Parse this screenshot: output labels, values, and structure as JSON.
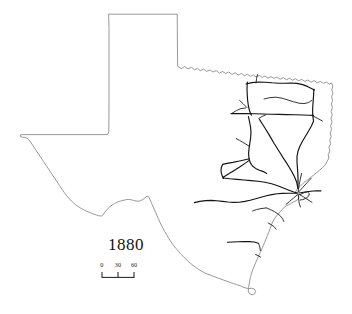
{
  "figure": {
    "kind": "historical-thematic-map",
    "year_label": "1880",
    "background_color": "#ffffff",
    "outline_color": "#8c8c8c",
    "rail_color": "#121212",
    "text_color": "#141414"
  },
  "scale_bar": {
    "unit_note": "",
    "ticks": [
      {
        "label": "0",
        "value": 0,
        "x_pct": 14
      },
      {
        "label": "30",
        "value": 30,
        "x_pct": 37
      },
      {
        "label": "60",
        "value": 60,
        "x_pct": 60
      }
    ]
  },
  "map": {
    "state_outline_path": "M109.0,14.2 L177.2,14.2 L177.4,40.0 L177.6,66.2 L181.4,68.6 L184.6,66.6 L188.0,68.8 L191.6,67.4 L194.4,69.8 L197.6,68.4 L200.2,70.6 L203.4,69.2 L206.6,71.4 L210.0,69.9 L213.0,72.0 L216.2,70.6 L219.4,73.0 L222.6,71.4 L225.6,73.6 L228.8,72.0 L232.0,74.4 L235.2,72.8 L238.2,75.0 L241.4,73.4 L244.4,75.8 L247.4,74.2 L250.4,76.4 L253.2,74.8 L256.2,77.0 L259.2,75.4 L262.2,77.4 L265.0,76.0 L268.0,78.2 L271.0,76.6 L274.0,78.4 L277.0,77.0 L280.2,79.2 L283.4,77.6 L286.4,79.8 L289.6,78.2 L292.6,80.2 L295.6,78.8 L298.6,80.8 L301.8,79.4 L304.8,81.4 L307.8,80.0 L311.0,82.2 L314.2,80.6 L317.4,82.8 L320.4,81.4 L323.4,83.4 L326.4,82.0 L329.2,84.2 L331.6,83.0 L332.8,86.0 L331.8,89.6 L332.8,93.2 L331.6,96.8 L332.6,100.4 L331.4,104.0 L332.4,107.6 L331.2,111.4 L332.2,115.0 L331.0,118.6 L332.0,122.2 L330.6,125.8 L331.6,129.4 L330.2,133.0 L331.2,136.6 L329.8,140.2 L330.6,143.8 L329.0,147.4 L329.8,151.0 L328.2,154.6 L328.8,158.2 L327.0,161.6 L325.2,164.8 L322.6,167.6 L319.6,170.2 L316.4,172.8 L313.2,175.4 L310.0,178.0 L306.6,180.6 L303.2,183.2 L300.2,186.2 L297.4,189.2 L295.0,192.4 L296.8,194.4 L299.0,196.2 L298.4,199.0 L296.0,200.8 L293.0,202.2 L290.2,203.8 L287.0,205.4 L284.0,207.6 L281.4,210.2 L279.0,213.0 L276.6,215.8 L274.4,218.8 L272.6,222.0 L271.2,225.4 L270.0,228.8 L268.8,232.2 L267.4,235.6 L266.0,239.0 L264.6,242.4 L263.2,245.8 L261.8,249.2 L260.2,252.6 L258.6,256.0 L257.0,259.4 L255.6,262.8 L254.2,266.2 L252.8,269.6 L251.6,273.0 L250.6,276.6 L249.8,280.2 L249.2,283.8 L248.6,287.4 L248.2,291.0 L249.4,293.6 L252.2,294.8 L254.6,293.8 L255.6,291.4 L254.2,289.0 L251.6,288.2 L249.0,288.6 L245.8,288.0 L242.8,287.0 L239.8,285.6 L236.6,284.6 L233.4,283.6 L230.2,282.4 L227.0,281.2 L223.8,280.2 L220.6,279.0 L217.4,277.8 L214.2,276.6 L211.0,275.4 L207.8,274.2 L204.6,272.8 L201.6,271.2 L198.6,269.4 L195.8,267.4 L193.0,265.4 L190.4,263.2 L187.8,261.0 L185.4,258.6 L183.0,256.2 L180.6,253.8 L178.4,251.2 L176.2,248.6 L174.0,246.0 L172.0,243.2 L170.0,240.4 L168.2,237.4 L166.4,234.4 L164.6,231.4 L163.0,228.4 L161.4,225.2 L159.8,222.0 L158.4,218.8 L157.0,215.6 L155.6,212.4 L154.2,209.2 L152.8,206.0 L151.4,202.8 L150.0,199.6 L148.6,196.6 L147.0,196.0 L145.0,197.8 L143.0,199.4 L140.8,200.6 L138.4,201.2 L136.0,201.0 L133.6,200.4 L131.2,199.8 L128.8,199.4 L126.4,199.6 L124.0,200.2 L121.6,200.8 L119.2,201.4 L116.8,202.4 L114.4,203.6 L112.2,205.0 L110.0,206.6 L108.0,208.4 L106.2,210.4 L104.6,212.6 L103.2,214.8 L101.4,216.0 L99.0,215.8 L96.6,215.0 L94.2,214.2 L91.8,213.4 L89.4,212.4 L87.0,211.4 L84.6,210.2 L82.2,209.0 L79.8,207.6 L77.6,206.2 L75.4,204.6 L73.4,202.8 L71.4,201.0 L69.6,199.0 L67.8,197.0 L66.0,194.8 L64.4,192.6 L62.8,190.4 L61.2,188.0 L59.6,185.6 L58.0,183.2 L56.4,180.8 L54.8,178.4 L53.2,176.0 L51.6,173.6 L50.0,171.2 L48.4,168.8 L46.8,166.4 L45.2,164.0 L43.6,161.6 L42.0,159.2 L40.4,156.8 L38.8,154.4 L37.2,152.0 L35.6,149.6 L34.0,147.2 L32.4,144.8 L30.8,142.4 L29.2,140.2 L27.2,138.4 L24.8,137.4 L22.2,137.2 L20.2,136.4 L20.4,134.8 L23.4,134.6 L27.0,134.6 L31.0,134.6 L36.0,134.6 L42.0,134.6 L49.0,134.6 L57.0,134.6 L66.0,134.6 L75.0,134.6 L84.0,134.6 L92.0,134.6 L99.0,134.6 L104.0,134.6 L107.6,134.6 L108.8,132.0 L108.9,120.0 L109.0,104.0 L109.0,86.0 L109.0,66.0 L109.0,46.0 L109.0,28.0 Z",
    "rail_lines": [
      {
        "name": "red-river-northeast-trunk",
        "path": "M246.0,84.0 L252.0,82.6 L258.6,82.0 L265.4,82.2 L272.0,82.8 L278.6,83.2 L285.0,83.2 L291.0,83.0 L297.0,83.4 L302.6,84.6 L307.4,86.4 L311.4,88.4 L314.6,90.0",
        "weight": "normal"
      },
      {
        "name": "northeast-loop-north-edge",
        "path": "M247.4,82.0 L247.0,88.0 L247.2,94.0 L247.6,100.0 L248.4,106.0 L249.6,111.0 L251.4,115.2",
        "weight": "normal"
      },
      {
        "name": "northeast-loop-east-edge",
        "path": "M313.8,89.4 L313.6,95.0 L313.2,100.6 L312.8,106.0 L312.6,111.0 L312.8,115.8 L313.4,120.4",
        "weight": "normal"
      },
      {
        "name": "northeast-loop-south-edge",
        "path": "M231.0,113.6 L239.0,113.6 L247.0,113.6 L255.0,113.8 L263.0,114.0 L271.0,114.2 L279.0,114.4 L287.0,114.6 L295.0,114.8 L303.0,115.0 L309.0,115.2 L313.4,115.4",
        "weight": "normal"
      },
      {
        "name": "northeast-inner-branch",
        "path": "M264.0,99.0 L270.0,97.6 L276.0,97.2 L282.0,98.2 L288.0,100.0 L293.6,101.8 L299.0,103.2 L304.0,103.6 L308.4,102.6 L311.8,100.4",
        "weight": "thin"
      },
      {
        "name": "sherman-spur-north",
        "path": "M256.0,83.0 L256.6,78.6 L257.4,74.6",
        "weight": "thin"
      },
      {
        "name": "jefferson-spur",
        "path": "M313.0,116.0 L318.0,118.6 L322.4,121.0",
        "weight": "thin"
      },
      {
        "name": "dallas-junction-west-trunk",
        "path": "M231.4,113.6 L236.4,110.6 L241.0,108.6 L245.6,108.0",
        "weight": "thin"
      },
      {
        "name": "dallas-junction-spur-nw",
        "path": "M247.0,107.6 L243.0,103.6 L239.6,100.4",
        "weight": "thin"
      },
      {
        "name": "central-texas-trunk-south",
        "path": "M248.4,116.6 L249.6,122.0 L250.6,127.4 L251.0,132.8 L250.6,138.2 L249.8,143.4 L249.0,148.6 L248.6,153.6 L249.0,158.4 L250.2,162.6 L252.4,166.0 L255.6,168.4 L259.4,170.2 L263.4,171.6 L266.6,173.4",
        "weight": "normal"
      },
      {
        "name": "east-trunk-to-houston",
        "path": "M313.6,121.0 L311.4,126.0 L308.6,131.0 L305.6,136.0 L302.6,141.0 L300.0,146.0 L298.0,151.2 L297.0,156.6 L297.0,162.0 L297.4,167.4 L297.8,172.8 L298.0,178.2 L298.0,183.6 L297.8,188.4",
        "weight": "normal"
      },
      {
        "name": "houston-dallas-diagonal",
        "path": "M259.4,119.4 L262.4,124.0 L265.4,128.8 L268.4,133.6 L271.2,138.4 L274.0,143.2 L277.0,148.0 L280.0,152.8 L283.0,157.6 L286.2,162.4 L289.2,167.2 L292.0,172.0 L294.6,177.0 L296.6,182.0 L297.6,187.0",
        "weight": "normal"
      },
      {
        "name": "mid-state-branch-upper",
        "path": "M258.8,118.4 L262.2,116.4 L265.6,115.0",
        "weight": "thin"
      },
      {
        "name": "central-branch-nw-spur",
        "path": "M249.0,146.0 L244.0,143.0 L239.6,140.4 L236.2,138.6",
        "weight": "thin"
      },
      {
        "name": "austin-junction-west",
        "path": "M249.4,158.8 L244.0,160.0 L238.4,161.2 L232.8,162.4 L227.2,163.4 L222.6,164.4",
        "weight": "normal"
      },
      {
        "name": "austin-junction-southwest",
        "path": "M249.2,160.4 L244.6,163.6 L240.0,166.8 L235.4,169.8 L230.8,172.6 L226.4,175.2 L222.8,177.4",
        "weight": "normal"
      },
      {
        "name": "west-loop-return",
        "path": "M222.6,164.6 L221.4,167.2 L221.0,170.2 L221.4,173.4 L222.4,176.4 L223.6,178.4",
        "weight": "normal"
      },
      {
        "name": "san-antonio-trunk",
        "path": "M223.0,178.0 L230.0,178.8 L237.0,179.4 L244.0,180.0 L251.0,180.6 L258.0,181.2 L265.0,182.2 L271.6,183.8 L277.6,185.8 L283.4,188.0 L289.0,190.2 L293.8,192.0 L297.2,193.0",
        "weight": "normal"
      },
      {
        "name": "south-west-long-line",
        "path": "M194.4,202.6 L200.0,201.4 L205.6,200.6 L211.2,200.4 L216.8,200.8 L222.4,201.4 L228.0,202.0 L233.6,202.4 L239.2,202.2 L244.8,201.4 L250.2,200.2 L255.6,198.8 L261.0,197.2 L266.4,195.8 L271.8,194.6 L277.2,193.8 L282.6,193.4 L288.0,193.2 L293.2,193.2 L297.0,193.2",
        "weight": "normal"
      },
      {
        "name": "houston-hub-spur-north",
        "path": "M298.0,192.4 L299.0,186.0 L300.2,179.6 L301.6,173.4",
        "weight": "thin"
      },
      {
        "name": "houston-hub-spur-northeast",
        "path": "M298.6,192.0 L303.0,187.2 L307.2,182.6 L311.2,178.2",
        "weight": "thin"
      },
      {
        "name": "houston-hub-spur-east",
        "path": "M299.2,193.0 L305.0,192.0 L310.8,191.2 L316.4,190.8 L321.0,190.8",
        "weight": "normal"
      },
      {
        "name": "houston-hub-spur-southeast",
        "path": "M299.0,194.2 L303.6,197.0 L308.0,199.8 L312.0,202.4",
        "weight": "thin"
      },
      {
        "name": "galveston-bay-loop",
        "path": "M300.2,194.6 L304.0,192.6 L307.4,191.8 L309.4,193.6 L308.4,196.4 L305.8,198.4 L302.8,199.6 L300.2,200.0",
        "weight": "thin"
      },
      {
        "name": "houston-hub-spur-south",
        "path": "M298.4,194.6 L298.6,199.0 L299.2,203.2 L300.4,207.0",
        "weight": "thin"
      },
      {
        "name": "houston-hub-spur-southwest",
        "path": "M297.4,194.8 L293.4,198.2 L289.6,201.4 L286.0,204.4",
        "weight": "thin"
      },
      {
        "name": "victoria-coastal-branch",
        "path": "M266.2,207.8 L270.4,209.6 L274.4,211.6 L277.8,213.8 L280.6,216.2 L282.6,218.8 L283.8,221.4",
        "weight": "thin"
      },
      {
        "name": "coastal-spur-west",
        "path": "M265.8,208.0 L261.0,208.6 L256.4,209.6 L252.6,211.0",
        "weight": "thin"
      },
      {
        "name": "gulf-spur-middle",
        "path": "M268.2,223.0 L271.4,224.8 L274.2,226.8 L276.2,229.2",
        "weight": "thin"
      },
      {
        "name": "corpus-christi-line",
        "path": "M227.4,242.2 L232.8,242.0 L238.2,241.8 L243.6,241.6 L249.0,241.6 L254.2,242.0 L258.4,243.2",
        "weight": "normal"
      },
      {
        "name": "corpus-spur-south",
        "path": "M258.6,243.4 L259.8,247.0 L260.4,250.6",
        "weight": "thin"
      },
      {
        "name": "laredo-short-spur",
        "path": "M255.6,254.6 L258.2,255.6 L260.6,257.2",
        "weight": "thin"
      }
    ]
  }
}
